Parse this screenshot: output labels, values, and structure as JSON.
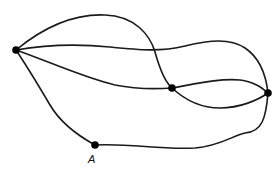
{
  "diagram": {
    "type": "graph",
    "colors": {
      "edge": "#1a1a1a",
      "node": "#000000",
      "background": "#ffffff"
    },
    "nodes": [
      {
        "id": "L",
        "label": ""
      },
      {
        "id": "M",
        "label": ""
      },
      {
        "id": "R",
        "label": ""
      },
      {
        "id": "A",
        "label": "A"
      }
    ],
    "edges": [
      {
        "from": "L",
        "to": "M",
        "kind": "upper-arc"
      },
      {
        "from": "L",
        "to": "R",
        "kind": "middle-wave"
      },
      {
        "from": "L",
        "to": "M",
        "kind": "lower-curve"
      },
      {
        "from": "L",
        "to": "A",
        "kind": "left-descent"
      },
      {
        "from": "A",
        "to": "R",
        "kind": "bottom-curve"
      },
      {
        "from": "M",
        "to": "R",
        "kind": "upper"
      },
      {
        "from": "M",
        "to": "R",
        "kind": "lower"
      }
    ]
  }
}
